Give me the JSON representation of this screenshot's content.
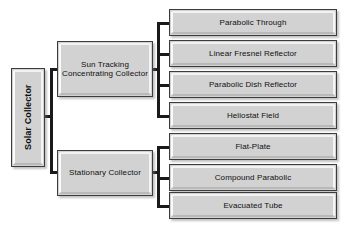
{
  "diagram": {
    "orientation": "left-to-right tree",
    "colors": {
      "box_fill": "#d2d2d2",
      "box_border": "#3c3c3c",
      "bevel_highlight": "#fafafa",
      "connector": "#1a1a1a",
      "background": "#ffffff",
      "text": "#101010"
    }
  },
  "root": {
    "label": "Solar Collector",
    "orientation": "vertical"
  },
  "branches": [
    {
      "id": "sun-tracking",
      "label": "Sun Tracking\nConcentrating Collector",
      "children": [
        {
          "id": "parabolic-through",
          "label": "Parabolic Through"
        },
        {
          "id": "linear-fresnel-reflector",
          "label": "Linear Fresnel Reflector"
        },
        {
          "id": "parabolic-dish-reflector",
          "label": "Parabolic Dish Reflector"
        },
        {
          "id": "heliostat-field",
          "label": "Heliostat Field"
        }
      ]
    },
    {
      "id": "stationary",
      "label": "Stationary Collector",
      "children": [
        {
          "id": "flat-plate",
          "label": "Flat-Plate"
        },
        {
          "id": "compound-parabolic",
          "label": "Compound Parabolic"
        },
        {
          "id": "evacuated-tube",
          "label": "Evacuated Tube"
        }
      ]
    }
  ],
  "leaves_flat": [
    "Parabolic Through",
    "Linear Fresnel Reflector",
    "Parabolic Dish Reflector",
    "Heliostat Field",
    "Flat-Plate",
    "Compound Parabolic",
    "Evacuated Tube"
  ]
}
